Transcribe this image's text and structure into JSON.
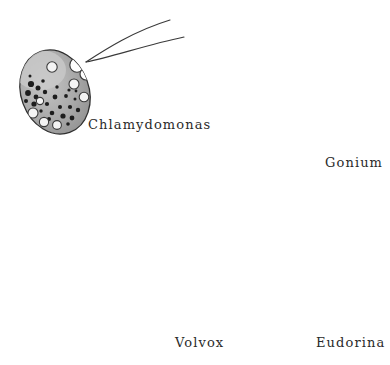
{
  "figure": {
    "kind": "scientific-illustration",
    "background_color": "#ffffff",
    "ink_color": "#2a2a2a",
    "matrix_gray": "#9a9a9a",
    "cell_fill": "#efefef"
  },
  "labels": {
    "chlamydomonas": "Chlamydomonas",
    "gonium": "Gonium",
    "volvox": "Volvox",
    "eudorina": "Eudorina"
  },
  "organisms": [
    {
      "id": "chlamydomonas",
      "name": "Chlamydomonas",
      "form": "single-cell",
      "outline": "ellipse",
      "center": [
        55,
        92
      ],
      "radii": [
        34,
        43
      ],
      "rotation_deg": -20,
      "body_fill": "#a8a8a8",
      "flagella_count": 2,
      "flagella_origin": [
        86,
        62
      ],
      "flagella_paths": [
        "M86,62 C110,48 140,30 168,21",
        "M86,62 C114,56 146,44 182,38"
      ],
      "contractile_vacuoles": [
        [
          78,
          66,
          7
        ],
        [
          86,
          74,
          6
        ]
      ],
      "ringed_vacuoles": [
        [
          52,
          67,
          5
        ],
        [
          74,
          84,
          5
        ],
        [
          84,
          97,
          5
        ],
        [
          33,
          113,
          5
        ],
        [
          44,
          122,
          5
        ],
        [
          57,
          125,
          5
        ],
        [
          40,
          101,
          4
        ]
      ],
      "dark_granules": [
        [
          31,
          84
        ],
        [
          38,
          88
        ],
        [
          28,
          93
        ],
        [
          36,
          97
        ],
        [
          45,
          92
        ],
        [
          34,
          104
        ],
        [
          47,
          104
        ],
        [
          55,
          97
        ],
        [
          60,
          107
        ],
        [
          52,
          113
        ],
        [
          63,
          116
        ],
        [
          70,
          107
        ],
        [
          72,
          118
        ],
        [
          66,
          96
        ],
        [
          78,
          110
        ],
        [
          26,
          101
        ],
        [
          43,
          81
        ],
        [
          57,
          87
        ],
        [
          69,
          90
        ],
        [
          49,
          119
        ]
      ]
    },
    {
      "id": "gonium",
      "name": "Gonium",
      "form": "flat-plate-colony",
      "outline": "rounded-square",
      "bounds": [
        222,
        57,
        86,
        86
      ],
      "corner_radius": 9,
      "matrix_fill": "#9e9e9e",
      "cell_count": 16,
      "grid": [
        4,
        4
      ],
      "cell_shape": "pear",
      "cell_radius": 9,
      "flagella_per_cell": 2,
      "flagella_length": 46
    },
    {
      "id": "volvox",
      "name": "Volvox",
      "form": "spherical-colony",
      "outline": "circle",
      "center": [
        110,
        258
      ],
      "radius": 92,
      "surface": "polygonal cell mosaic",
      "somatic_cell_count": 600,
      "flagella_bristles": 150,
      "bristle_length": 9,
      "daughter_colonies": [
        [
          124,
          288,
          13
        ],
        [
          163,
          291,
          11
        ],
        [
          85,
          305,
          12
        ]
      ]
    },
    {
      "id": "eudorina",
      "name": "Eudorina",
      "form": "spherical-colony",
      "outline": "circle",
      "center": [
        299,
        262
      ],
      "radius": 63,
      "matrix_fill": "#9e9e9e",
      "cell_count": 17,
      "cell_shape": "round",
      "cell_radius": 11,
      "flagella_per_cell": 2,
      "flagella_length": 40
    }
  ]
}
